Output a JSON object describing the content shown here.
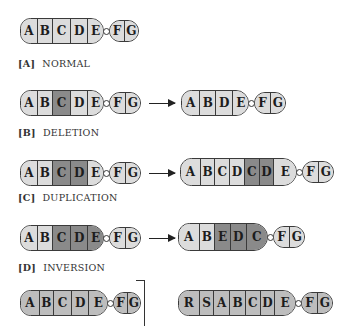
{
  "colors": {
    "light": "#dcdcdc",
    "medium": "#bdbdbd",
    "dark": "#8a8a8a",
    "outline": "#3a3a3a"
  },
  "panels": [
    {
      "tag": "[A]",
      "name": "NORMAL",
      "before": {
        "long_arm": [
          "A",
          "B",
          "C",
          "D",
          "E"
        ],
        "short_arm": [
          "F",
          "G"
        ],
        "shading": [
          "light",
          "light",
          "light",
          "light",
          "light",
          "light",
          "light"
        ]
      },
      "after": null
    },
    {
      "tag": "[B]",
      "name": "DELETION",
      "before": {
        "long_arm": [
          "A",
          "B",
          "C",
          "D",
          "E"
        ],
        "short_arm": [
          "F",
          "G"
        ],
        "highlight": [
          "C"
        ]
      },
      "after": {
        "long_arm": [
          "A",
          "B",
          "D",
          "E"
        ],
        "short_arm": [
          "F",
          "G"
        ]
      }
    },
    {
      "tag": "[C]",
      "name": "DUPLICATION",
      "before": {
        "long_arm": [
          "A",
          "B",
          "C",
          "D",
          "E"
        ],
        "short_arm": [
          "F",
          "G"
        ],
        "highlight": [
          "C",
          "D"
        ]
      },
      "after": {
        "long_arm": [
          "A",
          "B",
          "C",
          "D",
          "C",
          "D",
          "E"
        ],
        "short_arm": [
          "F",
          "G"
        ],
        "highlight_positions": [
          4,
          5
        ]
      }
    },
    {
      "tag": "[D]",
      "name": "INVERSION",
      "before": {
        "long_arm": [
          "A",
          "B",
          "C",
          "D",
          "E"
        ],
        "short_arm": [
          "F",
          "G"
        ],
        "highlight": [
          "C",
          "D",
          "E"
        ]
      },
      "after": {
        "long_arm": [
          "A",
          "B",
          "E",
          "D",
          "C"
        ],
        "short_arm": [
          "F",
          "G"
        ],
        "highlight": [
          "E",
          "D",
          "C"
        ]
      }
    },
    {
      "tag": "[E]",
      "name": "",
      "before": {
        "long_arm": [
          "A",
          "B",
          "C",
          "D",
          "E"
        ],
        "short_arm": [
          "F",
          "G"
        ]
      },
      "after": {
        "long_arm": [
          "R",
          "S",
          "A",
          "B",
          "C",
          "D",
          "E"
        ],
        "short_arm": [
          "F",
          "G"
        ]
      }
    }
  ],
  "labels": {
    "a_tag": "[A]",
    "a_name": "NORMAL",
    "b_tag": "[B]",
    "b_name": "DELETION",
    "c_tag": "[C]",
    "c_name": "DUPLICATION",
    "d_tag": "[D]",
    "d_name": "INVERSION"
  },
  "seg": {
    "A": "A",
    "B": "B",
    "C": "C",
    "D": "D",
    "E": "E",
    "F": "F",
    "G": "G",
    "R": "R",
    "S": "S"
  }
}
